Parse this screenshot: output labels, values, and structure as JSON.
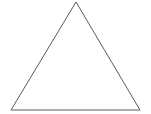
{
  "canvas": {
    "width": 151,
    "height": 114,
    "background_color": "#ffffff"
  },
  "figure": {
    "title": "",
    "shape_name": "triangle"
  },
  "chart_data": {
    "type": "diagram",
    "subtype": "geometric-line-drawing",
    "title": "",
    "subtitle": "",
    "xlabel": "",
    "ylabel": "",
    "grid": false,
    "legend": null,
    "axes": false,
    "annotations": [],
    "shapes": [
      {
        "name": "triangle",
        "kind": "polygon",
        "closed": true,
        "filled": false,
        "fill_color": "none",
        "stroke_color": "#5a5a5a",
        "stroke_width": 1,
        "vertices": [
          {
            "label": "apex",
            "x": 76,
            "y": 2
          },
          {
            "label": "bottom-right",
            "x": 140,
            "y": 110
          },
          {
            "label": "bottom-left",
            "x": 11,
            "y": 110
          }
        ],
        "points_string": "76,2 140,110 11,110"
      }
    ]
  }
}
